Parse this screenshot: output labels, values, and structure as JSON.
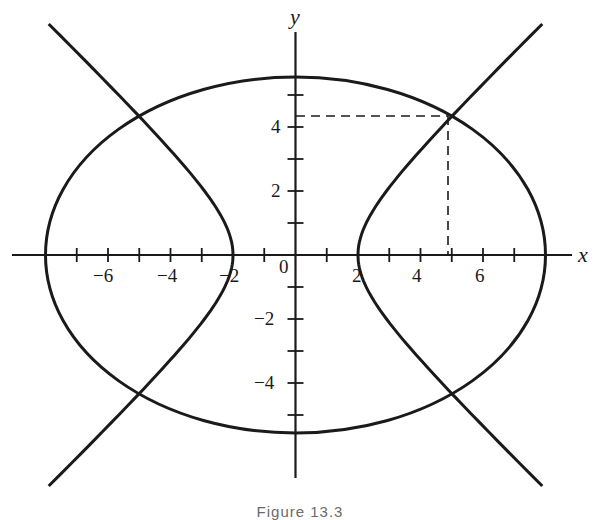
{
  "figure": {
    "caption": "Figure 13.3",
    "axes": {
      "x_label": "x",
      "y_label": "y",
      "origin_label": "0",
      "x_tick_labels": [
        "−6",
        "−4",
        "−2",
        "2",
        "4",
        "6"
      ],
      "y_tick_labels": [
        "4",
        "2",
        "−2",
        "−4"
      ],
      "x_ticks": [
        -7,
        -6,
        -5,
        -4,
        -3,
        -2,
        -1,
        1,
        2,
        3,
        4,
        5,
        6,
        7
      ],
      "y_ticks": [
        -5,
        -4,
        -3,
        -2,
        -1,
        1,
        2,
        3,
        4,
        5
      ]
    },
    "curves": [
      {
        "name": "ellipse",
        "equation": "x^2/64 + y^2/b^2 = 1",
        "x_intercepts": [
          -8,
          8
        ],
        "y_intercepts": [
          -5.55,
          5.55
        ]
      },
      {
        "name": "hyperbola",
        "equation": "x^2/4 - y^2/c^2 = 1",
        "vertices": [
          -2,
          2
        ]
      }
    ],
    "intersection_points": [
      [
        5,
        4.33
      ],
      [
        -5,
        4.33
      ],
      [
        5,
        -4.33
      ],
      [
        -5,
        -4.33
      ]
    ],
    "highlighted_point": {
      "x": 5,
      "y": 4.33,
      "dashed_projection": true
    },
    "colors": {
      "stroke": "#1a1a1a",
      "background": "#ffffff"
    }
  }
}
